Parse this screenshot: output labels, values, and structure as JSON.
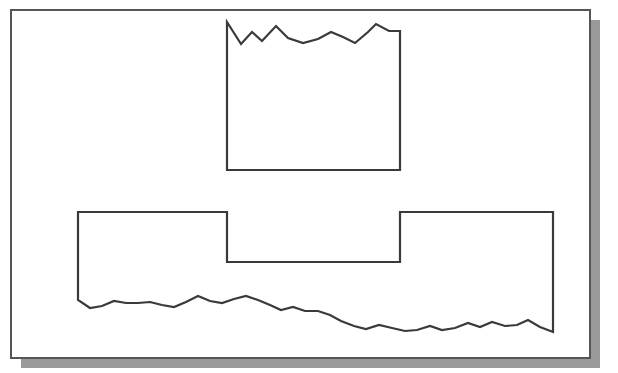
{
  "page": {
    "width": 618,
    "height": 373,
    "background_color": "#ffffff"
  },
  "sheet": {
    "name": "white-paper-sheet",
    "x": 11,
    "y": 10,
    "width": 579,
    "height": 348,
    "fill_color": "#ffffff",
    "border_color": "#555555",
    "border_width": 2
  },
  "drop_shadow": {
    "name": "paper-drop-shadow",
    "offset_x": 10,
    "offset_y": 10,
    "color": "#9a9a9a"
  },
  "chart_data": {
    "type": "line",
    "title": "",
    "subtitle": "",
    "xlabel": "",
    "ylabel": "",
    "grid": false,
    "legend_position": "none",
    "xlim": [
      0,
      618
    ],
    "ylim": [
      373,
      0
    ],
    "axis_visible": false,
    "stroke_color": "#3a3a3a",
    "stroke_width": 2.2,
    "fill": "none",
    "series": [
      {
        "name": "upper-profile",
        "closed": true,
        "points": [
          [
            227,
            22
          ],
          [
            241,
            44
          ],
          [
            252,
            32
          ],
          [
            262,
            41
          ],
          [
            276,
            26
          ],
          [
            288,
            38
          ],
          [
            303,
            43
          ],
          [
            318,
            39
          ],
          [
            331,
            32
          ],
          [
            343,
            37
          ],
          [
            355,
            43
          ],
          [
            368,
            32
          ],
          [
            376,
            24
          ],
          [
            389,
            31
          ],
          [
            400,
            31
          ],
          [
            400,
            170
          ],
          [
            227,
            170
          ]
        ]
      },
      {
        "name": "lower-profile",
        "closed": true,
        "points": [
          [
            78,
            212
          ],
          [
            227,
            212
          ],
          [
            227,
            262
          ],
          [
            400,
            262
          ],
          [
            400,
            212
          ],
          [
            553,
            212
          ],
          [
            553,
            332
          ],
          [
            540,
            327
          ],
          [
            528,
            320
          ],
          [
            517,
            325
          ],
          [
            505,
            326
          ],
          [
            492,
            322
          ],
          [
            480,
            327
          ],
          [
            468,
            323
          ],
          [
            455,
            328
          ],
          [
            442,
            330
          ],
          [
            430,
            326
          ],
          [
            417,
            330
          ],
          [
            405,
            331
          ],
          [
            392,
            328
          ],
          [
            379,
            325
          ],
          [
            366,
            329
          ],
          [
            354,
            326
          ],
          [
            341,
            321
          ],
          [
            330,
            315
          ],
          [
            318,
            311
          ],
          [
            305,
            311
          ],
          [
            293,
            307
          ],
          [
            281,
            310
          ],
          [
            270,
            305
          ],
          [
            258,
            300
          ],
          [
            246,
            296
          ],
          [
            234,
            299
          ],
          [
            222,
            303
          ],
          [
            210,
            301
          ],
          [
            198,
            296
          ],
          [
            186,
            302
          ],
          [
            174,
            307
          ],
          [
            162,
            305
          ],
          [
            150,
            302
          ],
          [
            138,
            303
          ],
          [
            126,
            303
          ],
          [
            114,
            301
          ],
          [
            102,
            306
          ],
          [
            90,
            308
          ],
          [
            78,
            300
          ]
        ]
      }
    ]
  }
}
